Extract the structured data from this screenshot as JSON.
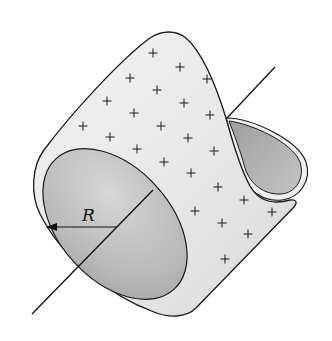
{
  "figure": {
    "radius_label": "R",
    "charge_symbol": "+",
    "colors": {
      "shell_surface": "#ececec",
      "inner_surface": "#b4b4b4",
      "inner_light": "#d2d2d2",
      "outline": "#1a1a1a",
      "background": "#ffffff"
    },
    "charges": [
      [
        153,
        53
      ],
      [
        180,
        67
      ],
      [
        207,
        79
      ],
      [
        130,
        78
      ],
      [
        157,
        90
      ],
      [
        184,
        103
      ],
      [
        210,
        115
      ],
      [
        107,
        101
      ],
      [
        134,
        113
      ],
      [
        161,
        126
      ],
      [
        188,
        138
      ],
      [
        214,
        151
      ],
      [
        83,
        126
      ],
      [
        110,
        137
      ],
      [
        137,
        149
      ],
      [
        164,
        162
      ],
      [
        191,
        173
      ],
      [
        218,
        187
      ],
      [
        244,
        200
      ],
      [
        272,
        212
      ],
      [
        195,
        211
      ],
      [
        222,
        223
      ],
      [
        248,
        234
      ],
      [
        225,
        259
      ]
    ]
  }
}
